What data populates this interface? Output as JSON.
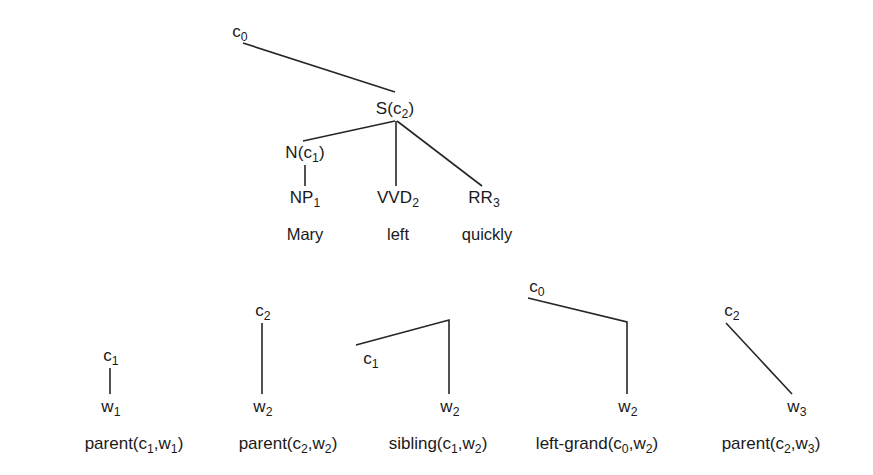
{
  "figure": {
    "type": "syntax-tree-diagram",
    "background_color": "#ffffff",
    "line_color": "#262626",
    "text_color": "#1a1a1a",
    "width": 873,
    "height": 475
  },
  "main_tree": {
    "name": "main-parse-tree",
    "sentence": "Mary left quickly",
    "nodes": [
      {
        "id": "root",
        "label": "c",
        "sub": "0",
        "x": 240,
        "y": 31
      },
      {
        "id": "s",
        "label": "S(c",
        "sub": "2",
        "suffix": ")",
        "x": 395,
        "y": 108
      },
      {
        "id": "n",
        "label": "N(c",
        "sub": "1",
        "suffix": ")",
        "x": 305,
        "y": 152
      },
      {
        "id": "np",
        "label": "NP",
        "sub": "1",
        "x": 305,
        "y": 197
      },
      {
        "id": "vvd",
        "label": "VVD",
        "sub": "2",
        "x": 398,
        "y": 197
      },
      {
        "id": "rr",
        "label": "RR",
        "sub": "3",
        "x": 484,
        "y": 197
      }
    ],
    "words": [
      {
        "id": "w-mary",
        "text": "Mary",
        "x": 305,
        "y": 234
      },
      {
        "id": "w-left",
        "text": "left",
        "x": 398,
        "y": 234
      },
      {
        "id": "w-quickly",
        "text": "quickly",
        "x": 487,
        "y": 234
      }
    ],
    "edges": [
      {
        "id": "root-to-s",
        "from": "root",
        "to": "s",
        "points": "243,43 395,92"
      },
      {
        "id": "s-to-n",
        "from": "s",
        "to": "n",
        "points": "395,121 303,141"
      },
      {
        "id": "s-to-vvd",
        "from": "s",
        "to": "vvd",
        "points": "396,121 396,186"
      },
      {
        "id": "s-to-rr",
        "from": "s",
        "to": "rr",
        "points": "397,121 482,186"
      },
      {
        "id": "n-to-np",
        "from": "n",
        "to": "np",
        "points": "305,165 305,186"
      }
    ]
  },
  "relation_examples": [
    {
      "id": "parent-c1-w1",
      "caption": {
        "prefix": "parent(c",
        "sub1": "1",
        "mid": ",w",
        "sub2": "1",
        "suffix": ")",
        "x": 134,
        "y": 443
      },
      "nodes": [
        {
          "id": "top",
          "label": "c",
          "sub": "1",
          "x": 111,
          "y": 355
        },
        {
          "id": "bottom",
          "label": "w",
          "sub": "1",
          "x": 111,
          "y": 406
        }
      ],
      "edges": [
        {
          "id": "edge-1",
          "points": "110,368 110,394"
        }
      ]
    },
    {
      "id": "parent-c2-w2",
      "caption": {
        "prefix": "parent(c",
        "sub1": "2",
        "mid": ",w",
        "sub2": "2",
        "suffix": ")",
        "x": 288,
        "y": 443
      },
      "nodes": [
        {
          "id": "top",
          "label": "c",
          "sub": "2",
          "x": 263,
          "y": 310
        },
        {
          "id": "bottom",
          "label": "w",
          "sub": "2",
          "x": 263,
          "y": 406
        }
      ],
      "edges": [
        {
          "id": "edge-1",
          "points": "262,323 262,394"
        }
      ]
    },
    {
      "id": "sibling-c1-w2",
      "caption": {
        "prefix": "sibling(c",
        "sub1": "1",
        "mid": ",w",
        "sub2": "2",
        "suffix": ")",
        "x": 438,
        "y": 443
      },
      "nodes": [
        {
          "id": "left",
          "label": "c",
          "sub": "1",
          "x": 371,
          "y": 358
        },
        {
          "id": "bottom",
          "label": "w",
          "sub": "2",
          "x": 450,
          "y": 406
        }
      ],
      "edges": [
        {
          "id": "edge-1",
          "points": "356,345 449,320 449,394"
        }
      ]
    },
    {
      "id": "left-grand-c0-w2",
      "caption": {
        "prefix": "left-grand(c",
        "sub1": "0",
        "mid": ",w",
        "sub2": "2",
        "suffix": ")",
        "x": 597,
        "y": 443
      },
      "nodes": [
        {
          "id": "top",
          "label": "c",
          "sub": "0",
          "x": 537,
          "y": 286
        },
        {
          "id": "bottom",
          "label": "w",
          "sub": "2",
          "x": 628,
          "y": 406
        }
      ],
      "edges": [
        {
          "id": "edge-1",
          "points": "528,298 627,322 627,394"
        }
      ]
    },
    {
      "id": "parent-c2-w3",
      "caption": {
        "prefix": "parent(c",
        "sub1": "2",
        "mid": ",w",
        "sub2": "3",
        "suffix": ")",
        "x": 771,
        "y": 443
      },
      "nodes": [
        {
          "id": "top",
          "label": "c",
          "sub": "2",
          "x": 732,
          "y": 310
        },
        {
          "id": "bottom",
          "label": "w",
          "sub": "3",
          "x": 797,
          "y": 406
        }
      ],
      "edges": [
        {
          "id": "edge-1",
          "points": "726,323 792,394"
        }
      ]
    }
  ]
}
